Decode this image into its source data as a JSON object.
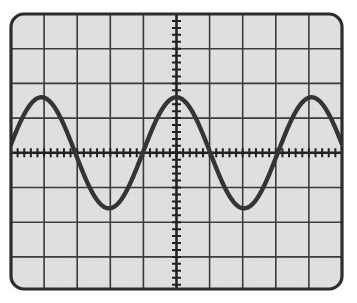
{
  "display": {
    "name": "oscilloscope-graticule-display",
    "kind": "waveform-screen",
    "background_color": "#e2e2e2",
    "border_color": "#2b2b2b",
    "grid_color": "#3a3a3a",
    "axis_color": "#1f1f1f",
    "trace_color": "#333333",
    "corner_radius": 14,
    "screen": {
      "x": 0,
      "y": 0,
      "width": 335,
      "height": 279
    },
    "plot_area": {
      "left": 2,
      "top": 2,
      "right": 333,
      "bottom": 277
    }
  },
  "graticule": {
    "horizontal_divisions": 10,
    "vertical_divisions": 8,
    "division_width_px": 33.1,
    "division_height_px": 34.7,
    "vertical_gridline_x": [
      2,
      35.1,
      68.2,
      101.3,
      134.4,
      167.5,
      200.6,
      233.7,
      266.8,
      299.9,
      333
    ],
    "horizontal_gridline_y": [
      2,
      36.7,
      71.4,
      106.1,
      140.8,
      175.5,
      210.2,
      244.9,
      277
    ],
    "center_axis_x": 167.5,
    "center_axis_y": 140.8,
    "minor_ticks_per_division": 5,
    "minor_tick_length_px": 9,
    "minor_tick_spacing_x_px": 6.62,
    "minor_tick_spacing_y_px": 6.94
  },
  "chart_data": {
    "type": "line",
    "title": "",
    "subtitle": "",
    "xlabel": "",
    "ylabel": "",
    "grid": true,
    "legend_position": "none",
    "xlim": [
      -5,
      5
    ],
    "ylim": [
      -4,
      4
    ],
    "xtick_labels": [],
    "ytick_labels": [],
    "annotations": [],
    "series": [
      {
        "name": "sine-trace",
        "waveform": "sine",
        "color": "#333333",
        "line_width_px": 4.4,
        "amplitude_div": 1.6,
        "period_div": 4.08,
        "phase_deg": 90,
        "vertical_offset_div": 0,
        "peak_points_px": [
          {
            "x": 35.1,
            "y": 75.3
          },
          {
            "x": 167.5,
            "y": 75.3
          },
          {
            "x": 299.9,
            "y": 75.3
          }
        ],
        "trough_points_px": [
          {
            "x": 101.3,
            "y": 206.3
          },
          {
            "x": 233.7,
            "y": 206.3
          }
        ],
        "zero_crossings_px": [
          68.2,
          134.4,
          200.6,
          266.8
        ],
        "left_edge_point_px": {
          "x": 2,
          "y": 141
        },
        "right_edge_point_px": {
          "x": 333,
          "y": 141
        }
      }
    ]
  }
}
